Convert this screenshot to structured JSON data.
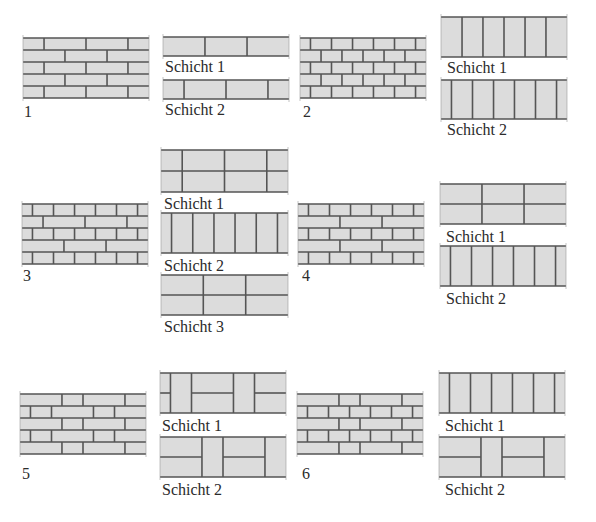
{
  "colors": {
    "brick": "#dcdcdc",
    "mortar": "#555555",
    "edge": "#9a9a9a"
  },
  "patterns": [
    {
      "id": "1",
      "label": "1",
      "box": [
        23,
        38,
        126,
        60
      ],
      "labelPos": [
        24,
        104
      ],
      "rows": [
        {
          "joints": [
            0.167,
            0.5,
            0.833
          ]
        },
        {
          "joints": [
            0.333,
            0.667
          ]
        },
        {
          "joints": [
            0.167,
            0.5,
            0.833
          ]
        },
        {
          "joints": [
            0.333,
            0.667
          ]
        },
        {
          "joints": [
            0.167,
            0.5,
            0.833
          ]
        }
      ],
      "layers": [
        {
          "label": "Schicht 1",
          "box": [
            163,
            37,
            126,
            19
          ],
          "labelPos": [
            165,
            59
          ],
          "type": "stretchers",
          "joints": [
            0.333,
            0.667
          ]
        },
        {
          "label": "Schicht 2",
          "box": [
            163,
            80,
            126,
            19
          ],
          "labelPos": [
            165,
            102
          ],
          "type": "stretchers",
          "joints": [
            0.167,
            0.5,
            0.833
          ]
        }
      ]
    },
    {
      "id": "2",
      "label": "2",
      "box": [
        300,
        38,
        126,
        60
      ],
      "labelPos": [
        303,
        104
      ],
      "rows": [
        {
          "joints": [
            0.083,
            0.25,
            0.417,
            0.583,
            0.75,
            0.917
          ]
        },
        {
          "joints": [
            0.167,
            0.333,
            0.5,
            0.667,
            0.833
          ]
        },
        {
          "joints": [
            0.083,
            0.25,
            0.417,
            0.583,
            0.75,
            0.917
          ]
        },
        {
          "joints": [
            0.167,
            0.333,
            0.5,
            0.667,
            0.833
          ]
        },
        {
          "joints": [
            0.083,
            0.25,
            0.417,
            0.583,
            0.75,
            0.917
          ]
        }
      ],
      "layers": [
        {
          "label": "Schicht 1",
          "box": [
            441,
            17,
            126,
            40
          ],
          "labelPos": [
            447,
            60
          ],
          "type": "headers",
          "joints": [
            0.167,
            0.333,
            0.5,
            0.667,
            0.833
          ]
        },
        {
          "label": "Schicht 2",
          "box": [
            441,
            80,
            126,
            39
          ],
          "labelPos": [
            447,
            122
          ],
          "type": "headers",
          "joints": [
            0.083,
            0.25,
            0.417,
            0.583,
            0.75,
            0.917
          ]
        }
      ]
    },
    {
      "id": "3",
      "label": "3",
      "box": [
        22,
        204,
        126,
        60
      ],
      "labelPos": [
        23,
        268
      ],
      "rows": [
        {
          "joints": [
            0.083,
            0.25,
            0.417,
            0.583,
            0.75,
            0.917
          ]
        },
        {
          "joints": [
            0.167,
            0.5,
            0.833
          ]
        },
        {
          "joints": [
            0.083,
            0.25,
            0.417,
            0.583,
            0.75,
            0.917
          ]
        },
        {
          "joints": [
            0.333,
            0.667
          ]
        },
        {
          "joints": [
            0.083,
            0.25,
            0.417,
            0.583,
            0.75,
            0.917
          ]
        }
      ],
      "layers": [
        {
          "label": "Schicht 1",
          "box": [
            161,
            150,
            127,
            42
          ],
          "labelPos": [
            164,
            196
          ],
          "type": "double",
          "joints": [
            0.167,
            0.5,
            0.833
          ]
        },
        {
          "label": "Schicht 2",
          "box": [
            161,
            213,
            127,
            40
          ],
          "labelPos": [
            164,
            258
          ],
          "type": "headers",
          "joints": [
            0.083,
            0.25,
            0.417,
            0.583,
            0.75,
            0.917
          ]
        },
        {
          "label": "Schicht 3",
          "box": [
            161,
            275,
            127,
            40
          ],
          "labelPos": [
            164,
            319
          ],
          "type": "double",
          "joints": [
            0.333,
            0.667
          ]
        }
      ]
    },
    {
      "id": "4",
      "label": "4",
      "box": [
        298,
        204,
        126,
        60
      ],
      "labelPos": [
        302,
        268
      ],
      "rows": [
        {
          "joints": [
            0.083,
            0.25,
            0.417,
            0.583,
            0.75,
            0.917
          ]
        },
        {
          "joints": [
            0.333,
            0.667
          ]
        },
        {
          "joints": [
            0.083,
            0.25,
            0.417,
            0.583,
            0.75,
            0.917
          ]
        },
        {
          "joints": [
            0.333,
            0.667
          ]
        },
        {
          "joints": [
            0.083,
            0.25,
            0.417,
            0.583,
            0.75,
            0.917
          ]
        }
      ],
      "layers": [
        {
          "label": "Schicht 1",
          "box": [
            440,
            184,
            126,
            40
          ],
          "labelPos": [
            446,
            229
          ],
          "type": "double",
          "joints": [
            0.333,
            0.667
          ]
        },
        {
          "label": "Schicht 2",
          "box": [
            440,
            246,
            126,
            40
          ],
          "labelPos": [
            446,
            291
          ],
          "type": "headers",
          "joints": [
            0.083,
            0.25,
            0.417,
            0.583,
            0.75,
            0.917
          ]
        }
      ]
    },
    {
      "id": "5",
      "label": "5",
      "box": [
        20,
        394,
        126,
        60
      ],
      "labelPos": [
        22,
        466
      ],
      "rows": [
        {
          "joints": [
            0.333,
            0.5,
            0.833
          ]
        },
        {
          "joints": [
            0.083,
            0.25,
            0.583,
            0.75
          ]
        },
        {
          "joints": [
            0.333,
            0.5,
            0.833
          ]
        },
        {
          "joints": [
            0.083,
            0.25,
            0.583,
            0.75
          ]
        },
        {
          "joints": [
            0.333,
            0.5,
            0.833
          ]
        }
      ],
      "layers": [
        {
          "label": "Schicht 1",
          "box": [
            160,
            373,
            126,
            40
          ],
          "labelPos": [
            162,
            418
          ],
          "type": "mixed",
          "segments": [
            {
              "from": 0,
              "to": 0.083,
              "kind": "double"
            },
            {
              "from": 0.083,
              "to": 0.25,
              "kind": "header"
            },
            {
              "from": 0.25,
              "to": 0.583,
              "kind": "double"
            },
            {
              "from": 0.583,
              "to": 0.75,
              "kind": "header"
            },
            {
              "from": 0.75,
              "to": 1,
              "kind": "double"
            }
          ]
        },
        {
          "label": "Schicht 2",
          "box": [
            160,
            437,
            126,
            40
          ],
          "labelPos": [
            162,
            482
          ],
          "type": "mixed",
          "segments": [
            {
              "from": 0,
              "to": 0.333,
              "kind": "double"
            },
            {
              "from": 0.333,
              "to": 0.5,
              "kind": "header"
            },
            {
              "from": 0.5,
              "to": 0.833,
              "kind": "double"
            },
            {
              "from": 0.833,
              "to": 1,
              "kind": "header"
            }
          ]
        }
      ]
    },
    {
      "id": "6",
      "label": "6",
      "box": [
        297,
        394,
        126,
        60
      ],
      "labelPos": [
        302,
        466
      ],
      "rows": [
        {
          "joints": [
            0.333,
            0.5,
            0.833
          ]
        },
        {
          "joints": [
            0.083,
            0.25,
            0.417,
            0.583,
            0.75,
            0.917
          ]
        },
        {
          "joints": [
            0.333,
            0.5,
            0.833
          ]
        },
        {
          "joints": [
            0.083,
            0.25,
            0.417,
            0.583,
            0.75,
            0.917
          ]
        },
        {
          "joints": [
            0.333,
            0.5,
            0.833
          ]
        }
      ],
      "layers": [
        {
          "label": "Schicht 1",
          "box": [
            439,
            373,
            126,
            40
          ],
          "labelPos": [
            445,
            418
          ],
          "type": "headers",
          "joints": [
            0.083,
            0.25,
            0.417,
            0.583,
            0.75,
            0.917
          ]
        },
        {
          "label": "Schicht 2",
          "box": [
            439,
            437,
            126,
            40
          ],
          "labelPos": [
            445,
            482
          ],
          "type": "mixed",
          "segments": [
            {
              "from": 0,
              "to": 0.333,
              "kind": "double"
            },
            {
              "from": 0.333,
              "to": 0.5,
              "kind": "header"
            },
            {
              "from": 0.5,
              "to": 0.833,
              "kind": "double"
            },
            {
              "from": 0.833,
              "to": 1,
              "kind": "header"
            }
          ]
        }
      ]
    }
  ]
}
